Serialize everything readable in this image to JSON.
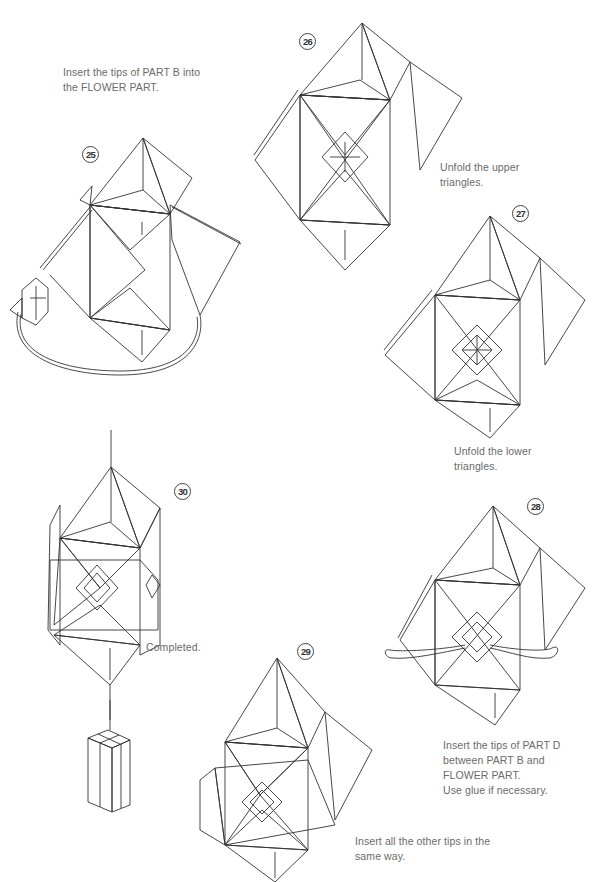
{
  "page": {
    "background": "#ffffff",
    "colors": {
      "paper_dark": "#8d8d8d",
      "paper_mid": "#b5b5b5",
      "paper_light": "#ececec",
      "line": "#333333",
      "text": "#6a6a6a"
    }
  },
  "steps": [
    {
      "number": "25",
      "caption_lines": [
        "Insert the tips of PART B into",
        "the FLOWER PART."
      ]
    },
    {
      "number": "26",
      "caption_lines": [
        "Unfold the upper",
        "triangles."
      ]
    },
    {
      "number": "27",
      "caption_lines": [
        "Unfold the lower",
        "triangles."
      ]
    },
    {
      "number": "28",
      "caption_lines": [
        "Insert the tips of PART D",
        "between PART B and",
        "FLOWER PART.",
        "Use glue if necessary."
      ]
    },
    {
      "number": "29",
      "caption_lines": [
        "Insert all the other tips in the",
        "same way."
      ]
    },
    {
      "number": "30",
      "caption_lines": [
        "Completed."
      ]
    }
  ]
}
